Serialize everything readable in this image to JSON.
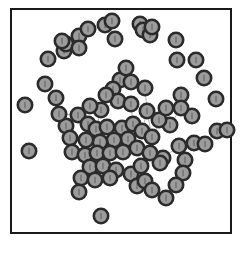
{
  "figure": {
    "type": "network-graph-scatter",
    "title": "",
    "background_color": "#ffffff",
    "frame": {
      "name": "plot-frame",
      "x": 11,
      "y": 9,
      "width": 220,
      "height": 224,
      "stroke_color": "#1a1a1a",
      "stroke_width": 2,
      "fill": "#ffffff"
    },
    "node_style": {
      "fill_color": "#9c9c9c",
      "stroke_color": "#2b2b2b",
      "stroke_width": 2.6,
      "radius": 7.2,
      "inner_mark_color": "#6e6e6e"
    },
    "edge_style": {
      "stroke_color": "#b9b9b9",
      "stroke_width": 1.0
    }
  },
  "chart_data": {
    "type": "scatter",
    "title": "",
    "xlabel": "",
    "ylabel": "",
    "grid": false,
    "legend": null,
    "xlim": [
      11,
      231
    ],
    "ylim": [
      9,
      233
    ],
    "node_count": 86,
    "edge_count": 40,
    "nodes": [
      {
        "id": 0,
        "x": 101,
        "y": 216,
        "group": "isolate"
      },
      {
        "id": 1,
        "x": 25,
        "y": 105,
        "group": "isolate"
      },
      {
        "id": 2,
        "x": 29,
        "y": 151,
        "group": "isolate"
      },
      {
        "id": 3,
        "x": 45,
        "y": 84,
        "group": "periphery"
      },
      {
        "id": 4,
        "x": 56,
        "y": 98,
        "group": "periphery"
      },
      {
        "id": 5,
        "x": 48,
        "y": 59,
        "group": "periphery"
      },
      {
        "id": 6,
        "x": 64,
        "y": 51,
        "group": "periphery"
      },
      {
        "id": 7,
        "x": 66,
        "y": 44,
        "group": "periphery"
      },
      {
        "id": 8,
        "x": 62,
        "y": 41,
        "group": "periphery"
      },
      {
        "id": 9,
        "x": 79,
        "y": 36,
        "group": "periphery"
      },
      {
        "id": 10,
        "x": 88,
        "y": 29,
        "group": "periphery"
      },
      {
        "id": 11,
        "x": 79,
        "y": 48,
        "group": "periphery"
      },
      {
        "id": 12,
        "x": 105,
        "y": 25,
        "group": "periphery"
      },
      {
        "id": 13,
        "x": 112,
        "y": 21,
        "group": "periphery"
      },
      {
        "id": 14,
        "x": 115,
        "y": 39,
        "group": "periphery"
      },
      {
        "id": 15,
        "x": 140,
        "y": 24,
        "group": "periphery"
      },
      {
        "id": 16,
        "x": 143,
        "y": 30,
        "group": "periphery"
      },
      {
        "id": 17,
        "x": 150,
        "y": 35,
        "group": "periphery"
      },
      {
        "id": 18,
        "x": 152,
        "y": 27,
        "group": "periphery"
      },
      {
        "id": 19,
        "x": 176,
        "y": 40,
        "group": "periphery"
      },
      {
        "id": 20,
        "x": 177,
        "y": 60,
        "group": "periphery"
      },
      {
        "id": 21,
        "x": 196,
        "y": 60,
        "group": "periphery"
      },
      {
        "id": 22,
        "x": 204,
        "y": 78,
        "group": "periphery"
      },
      {
        "id": 23,
        "x": 181,
        "y": 95,
        "group": "periphery"
      },
      {
        "id": 24,
        "x": 216,
        "y": 99,
        "group": "periphery"
      },
      {
        "id": 25,
        "x": 192,
        "y": 116,
        "group": "periphery"
      },
      {
        "id": 26,
        "x": 181,
        "y": 108,
        "group": "periphery"
      },
      {
        "id": 27,
        "x": 170,
        "y": 125,
        "group": "periphery"
      },
      {
        "id": 28,
        "x": 194,
        "y": 143,
        "group": "periphery"
      },
      {
        "id": 29,
        "x": 205,
        "y": 144,
        "group": "periphery"
      },
      {
        "id": 30,
        "x": 179,
        "y": 146,
        "group": "periphery"
      },
      {
        "id": 31,
        "x": 185,
        "y": 160,
        "group": "periphery"
      },
      {
        "id": 32,
        "x": 183,
        "y": 173,
        "group": "periphery"
      },
      {
        "id": 33,
        "x": 176,
        "y": 185,
        "group": "periphery"
      },
      {
        "id": 34,
        "x": 163,
        "y": 158,
        "group": "periphery"
      },
      {
        "id": 35,
        "x": 166,
        "y": 198,
        "group": "periphery"
      },
      {
        "id": 36,
        "x": 160,
        "y": 163,
        "group": "core"
      },
      {
        "id": 37,
        "x": 120,
        "y": 80,
        "group": "core"
      },
      {
        "id": 38,
        "x": 131,
        "y": 82,
        "group": "core"
      },
      {
        "id": 39,
        "x": 113,
        "y": 89,
        "group": "core"
      },
      {
        "id": 40,
        "x": 145,
        "y": 88,
        "group": "core"
      },
      {
        "id": 41,
        "x": 118,
        "y": 101,
        "group": "core"
      },
      {
        "id": 42,
        "x": 131,
        "y": 104,
        "group": "core"
      },
      {
        "id": 43,
        "x": 147,
        "y": 111,
        "group": "core"
      },
      {
        "id": 44,
        "x": 101,
        "y": 110,
        "group": "core"
      },
      {
        "id": 45,
        "x": 78,
        "y": 115,
        "group": "core"
      },
      {
        "id": 46,
        "x": 66,
        "y": 126,
        "group": "core"
      },
      {
        "id": 47,
        "x": 70,
        "y": 138,
        "group": "core"
      },
      {
        "id": 48,
        "x": 88,
        "y": 124,
        "group": "core"
      },
      {
        "id": 49,
        "x": 96,
        "y": 129,
        "group": "core"
      },
      {
        "id": 50,
        "x": 107,
        "y": 127,
        "group": "core"
      },
      {
        "id": 51,
        "x": 122,
        "y": 128,
        "group": "core"
      },
      {
        "id": 52,
        "x": 133,
        "y": 124,
        "group": "core"
      },
      {
        "id": 53,
        "x": 142,
        "y": 131,
        "group": "core"
      },
      {
        "id": 54,
        "x": 152,
        "y": 137,
        "group": "core"
      },
      {
        "id": 55,
        "x": 128,
        "y": 139,
        "group": "core"
      },
      {
        "id": 56,
        "x": 114,
        "y": 140,
        "group": "core"
      },
      {
        "id": 57,
        "x": 100,
        "y": 142,
        "group": "core"
      },
      {
        "id": 58,
        "x": 86,
        "y": 140,
        "group": "core"
      },
      {
        "id": 59,
        "x": 72,
        "y": 152,
        "group": "core"
      },
      {
        "id": 60,
        "x": 85,
        "y": 155,
        "group": "core"
      },
      {
        "id": 61,
        "x": 97,
        "y": 153,
        "group": "core"
      },
      {
        "id": 62,
        "x": 110,
        "y": 153,
        "group": "core"
      },
      {
        "id": 63,
        "x": 123,
        "y": 152,
        "group": "core"
      },
      {
        "id": 64,
        "x": 137,
        "y": 148,
        "group": "core"
      },
      {
        "id": 65,
        "x": 150,
        "y": 153,
        "group": "core"
      },
      {
        "id": 66,
        "x": 90,
        "y": 167,
        "group": "core"
      },
      {
        "id": 67,
        "x": 103,
        "y": 166,
        "group": "core"
      },
      {
        "id": 68,
        "x": 116,
        "y": 170,
        "group": "core"
      },
      {
        "id": 69,
        "x": 81,
        "y": 178,
        "group": "core"
      },
      {
        "id": 70,
        "x": 95,
        "y": 180,
        "group": "core"
      },
      {
        "id": 71,
        "x": 110,
        "y": 178,
        "group": "core"
      },
      {
        "id": 72,
        "x": 79,
        "y": 192,
        "group": "core"
      },
      {
        "id": 73,
        "x": 131,
        "y": 174,
        "group": "core"
      },
      {
        "id": 74,
        "x": 137,
        "y": 186,
        "group": "core"
      },
      {
        "id": 75,
        "x": 145,
        "y": 181,
        "group": "core"
      },
      {
        "id": 76,
        "x": 152,
        "y": 190,
        "group": "core"
      },
      {
        "id": 77,
        "x": 141,
        "y": 166,
        "group": "core"
      },
      {
        "id": 78,
        "x": 159,
        "y": 120,
        "group": "core"
      },
      {
        "id": 79,
        "x": 166,
        "y": 108,
        "group": "core"
      },
      {
        "id": 80,
        "x": 59,
        "y": 114,
        "group": "core"
      },
      {
        "id": 81,
        "x": 126,
        "y": 68,
        "group": "core"
      },
      {
        "id": 82,
        "x": 106,
        "y": 95,
        "group": "core"
      },
      {
        "id": 83,
        "x": 90,
        "y": 106,
        "group": "core"
      },
      {
        "id": 84,
        "x": 217,
        "y": 131,
        "group": "periphery"
      },
      {
        "id": 85,
        "x": 227,
        "y": 130,
        "group": "periphery"
      }
    ],
    "edges": [
      [
        81,
        38
      ],
      [
        81,
        37
      ],
      [
        37,
        38
      ],
      [
        38,
        40
      ],
      [
        37,
        39
      ],
      [
        39,
        41
      ],
      [
        41,
        42
      ],
      [
        42,
        52
      ],
      [
        40,
        43
      ],
      [
        43,
        54
      ],
      [
        44,
        41
      ],
      [
        44,
        49
      ],
      [
        45,
        48
      ],
      [
        46,
        47
      ],
      [
        47,
        59
      ],
      [
        48,
        49
      ],
      [
        49,
        50
      ],
      [
        50,
        51
      ],
      [
        51,
        55
      ],
      [
        52,
        53
      ],
      [
        53,
        54
      ],
      [
        55,
        56
      ],
      [
        56,
        57
      ],
      [
        57,
        58
      ],
      [
        58,
        60
      ],
      [
        59,
        60
      ],
      [
        60,
        61
      ],
      [
        61,
        62
      ],
      [
        62,
        63
      ],
      [
        63,
        64
      ],
      [
        64,
        65
      ],
      [
        65,
        78
      ],
      [
        78,
        79
      ],
      [
        54,
        65
      ],
      [
        66,
        67
      ],
      [
        67,
        68
      ],
      [
        68,
        71
      ],
      [
        69,
        70
      ],
      [
        70,
        71
      ],
      [
        71,
        73
      ],
      [
        73,
        77
      ],
      [
        77,
        75
      ],
      [
        75,
        76
      ],
      [
        74,
        75
      ],
      [
        36,
        34
      ],
      [
        34,
        30
      ],
      [
        30,
        31
      ],
      [
        31,
        32
      ],
      [
        32,
        33
      ],
      [
        33,
        35
      ],
      [
        64,
        77
      ],
      [
        43,
        53
      ],
      [
        45,
        80
      ],
      [
        83,
        45
      ],
      [
        82,
        83
      ],
      [
        39,
        82
      ],
      [
        27,
        79
      ],
      [
        26,
        27
      ],
      [
        25,
        26
      ]
    ]
  }
}
